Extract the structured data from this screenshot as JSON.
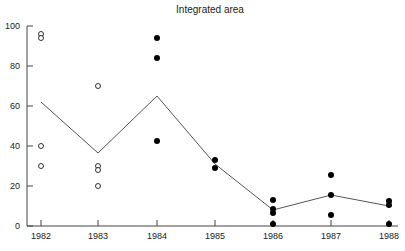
{
  "chart_data": {
    "type": "scatter",
    "title": "Integrated area",
    "xlabel": "",
    "ylabel": "",
    "categories": [
      "1982",
      "1983",
      "1984",
      "1985",
      "1986",
      "1987",
      "1988"
    ],
    "ylim": [
      0,
      100
    ],
    "yticks": [
      0,
      20,
      40,
      60,
      80,
      100
    ],
    "grid": false,
    "legend": null,
    "series": [
      {
        "name": "open circles",
        "marker": "open-circle",
        "points": [
          {
            "x": "1982",
            "y": 96
          },
          {
            "x": "1982",
            "y": 94
          },
          {
            "x": "1982",
            "y": 40
          },
          {
            "x": "1982",
            "y": 30
          },
          {
            "x": "1983",
            "y": 70
          },
          {
            "x": "1983",
            "y": 30
          },
          {
            "x": "1983",
            "y": 28
          },
          {
            "x": "1983",
            "y": 20
          }
        ]
      },
      {
        "name": "filled circles",
        "marker": "filled-circle",
        "points": [
          {
            "x": "1984",
            "y": 94
          },
          {
            "x": "1984",
            "y": 84
          },
          {
            "x": "1984",
            "y": 42.5
          },
          {
            "x": "1985",
            "y": 33
          },
          {
            "x": "1985",
            "y": 29
          },
          {
            "x": "1986",
            "y": 13
          },
          {
            "x": "1986",
            "y": 8.5
          },
          {
            "x": "1986",
            "y": 6.5
          },
          {
            "x": "1986",
            "y": 1
          },
          {
            "x": "1987",
            "y": 25.5
          },
          {
            "x": "1987",
            "y": 15.5
          },
          {
            "x": "1987",
            "y": 5.5
          },
          {
            "x": "1988",
            "y": 12.5
          },
          {
            "x": "1988",
            "y": 10.5
          },
          {
            "x": "1988",
            "y": 1
          }
        ]
      },
      {
        "name": "mean line",
        "type": "line",
        "values": [
          62,
          36.5,
          65,
          31,
          8,
          15.5,
          10
        ]
      }
    ]
  }
}
